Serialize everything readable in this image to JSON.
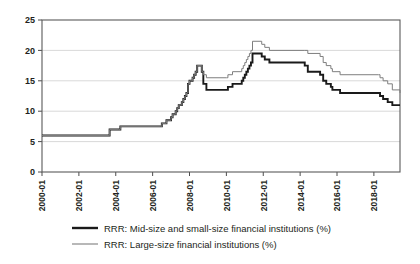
{
  "chart_data": {
    "type": "line",
    "title": "",
    "xlabel": "",
    "ylabel": "",
    "ylim": [
      0,
      25
    ],
    "yticks": [
      0,
      5,
      10,
      15,
      20,
      25
    ],
    "grid": true,
    "legend_position": "bottom",
    "xlim": [
      "2000-01",
      "2019-06"
    ],
    "xticks": [
      "2000-01",
      "2002-01",
      "2004-01",
      "2006-01",
      "2008-01",
      "2010-01",
      "2012-01",
      "2014-01",
      "2016-01",
      "2018-01"
    ],
    "colors": {
      "mid_small": "#1a1a1a",
      "large": "#7e7e7e",
      "grid": "#c9c9c9",
      "frame": "#595959"
    },
    "series": [
      {
        "name": "RRR: Mid-size and small-size financial institutions (%)",
        "color": "#1a1a1a",
        "points": [
          [
            "2000-01",
            6.0
          ],
          [
            "2003-08",
            6.0
          ],
          [
            "2003-09",
            7.0
          ],
          [
            "2004-03",
            7.0
          ],
          [
            "2004-04",
            7.5
          ],
          [
            "2006-06",
            7.5
          ],
          [
            "2006-07",
            8.0
          ],
          [
            "2006-10",
            8.5
          ],
          [
            "2007-01",
            9.0
          ],
          [
            "2007-02",
            9.5
          ],
          [
            "2007-04",
            10.0
          ],
          [
            "2007-05",
            10.5
          ],
          [
            "2007-06",
            11.0
          ],
          [
            "2007-08",
            11.5
          ],
          [
            "2007-09",
            12.0
          ],
          [
            "2007-10",
            12.5
          ],
          [
            "2007-11",
            13.0
          ],
          [
            "2007-12",
            14.5
          ],
          [
            "2008-01",
            15.0
          ],
          [
            "2008-03",
            15.5
          ],
          [
            "2008-04",
            16.0
          ],
          [
            "2008-05",
            16.5
          ],
          [
            "2008-06",
            17.5
          ],
          [
            "2008-09",
            16.5
          ],
          [
            "2008-10",
            14.5
          ],
          [
            "2008-12",
            13.5
          ],
          [
            "2010-01",
            13.5
          ],
          [
            "2010-02",
            14.0
          ],
          [
            "2010-05",
            14.5
          ],
          [
            "2010-11",
            15.0
          ],
          [
            "2010-12",
            15.5
          ],
          [
            "2011-01",
            16.0
          ],
          [
            "2011-02",
            16.5
          ],
          [
            "2011-03",
            17.0
          ],
          [
            "2011-04",
            17.5
          ],
          [
            "2011-05",
            18.0
          ],
          [
            "2011-06",
            19.5
          ],
          [
            "2011-12",
            19.0
          ],
          [
            "2012-02",
            18.5
          ],
          [
            "2012-05",
            18.0
          ],
          [
            "2014-04",
            17.5
          ],
          [
            "2014-06",
            16.5
          ],
          [
            "2015-02",
            16.0
          ],
          [
            "2015-04",
            15.0
          ],
          [
            "2015-06",
            14.5
          ],
          [
            "2015-09",
            14.0
          ],
          [
            "2015-10",
            13.5
          ],
          [
            "2016-03",
            13.0
          ],
          [
            "2018-04",
            13.0
          ],
          [
            "2018-05",
            12.5
          ],
          [
            "2018-07",
            12.0
          ],
          [
            "2018-10",
            11.5
          ],
          [
            "2019-01",
            11.0
          ],
          [
            "2019-06",
            11.0
          ]
        ]
      },
      {
        "name": "RRR: Large-size financial institutions (%)",
        "color": "#7e7e7e",
        "points": [
          [
            "2000-01",
            6.0
          ],
          [
            "2003-08",
            6.0
          ],
          [
            "2003-09",
            7.0
          ],
          [
            "2004-03",
            7.0
          ],
          [
            "2004-04",
            7.5
          ],
          [
            "2006-06",
            7.5
          ],
          [
            "2006-07",
            8.0
          ],
          [
            "2006-10",
            8.5
          ],
          [
            "2007-01",
            9.0
          ],
          [
            "2007-02",
            9.5
          ],
          [
            "2007-04",
            10.0
          ],
          [
            "2007-05",
            10.5
          ],
          [
            "2007-06",
            11.0
          ],
          [
            "2007-08",
            11.5
          ],
          [
            "2007-09",
            12.0
          ],
          [
            "2007-10",
            12.5
          ],
          [
            "2007-11",
            13.0
          ],
          [
            "2007-12",
            14.5
          ],
          [
            "2008-01",
            15.0
          ],
          [
            "2008-03",
            15.5
          ],
          [
            "2008-04",
            16.0
          ],
          [
            "2008-05",
            16.5
          ],
          [
            "2008-06",
            17.5
          ],
          [
            "2008-09",
            16.5
          ],
          [
            "2008-10",
            16.0
          ],
          [
            "2008-12",
            15.5
          ],
          [
            "2010-01",
            15.5
          ],
          [
            "2010-02",
            16.0
          ],
          [
            "2010-05",
            16.5
          ],
          [
            "2010-11",
            17.0
          ],
          [
            "2010-12",
            17.5
          ],
          [
            "2011-01",
            18.0
          ],
          [
            "2011-02",
            18.5
          ],
          [
            "2011-03",
            19.0
          ],
          [
            "2011-04",
            19.5
          ],
          [
            "2011-05",
            20.0
          ],
          [
            "2011-06",
            21.5
          ],
          [
            "2011-12",
            21.0
          ],
          [
            "2012-02",
            20.5
          ],
          [
            "2012-05",
            20.0
          ],
          [
            "2014-04",
            20.0
          ],
          [
            "2014-06",
            19.5
          ],
          [
            "2015-02",
            19.0
          ],
          [
            "2015-04",
            18.0
          ],
          [
            "2015-06",
            17.5
          ],
          [
            "2015-09",
            17.0
          ],
          [
            "2015-10",
            16.5
          ],
          [
            "2016-03",
            16.0
          ],
          [
            "2018-04",
            16.0
          ],
          [
            "2018-05",
            15.5
          ],
          [
            "2018-07",
            15.0
          ],
          [
            "2018-10",
            14.5
          ],
          [
            "2019-01",
            13.5
          ],
          [
            "2019-06",
            13.0
          ]
        ]
      }
    ]
  },
  "legend": {
    "entries": [
      {
        "label": "RRR: Mid-size and small-size financial institutions (%)",
        "marker": "line-thick-black"
      },
      {
        "label": "RRR: Large-size financial institutions (%)",
        "marker": "line-thin-gray"
      }
    ]
  }
}
